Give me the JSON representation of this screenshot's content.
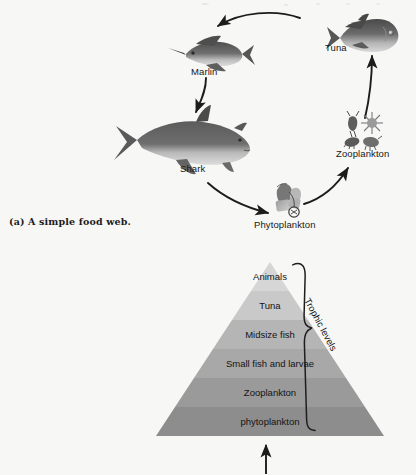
{
  "figure": {
    "caption": "(a) A simple food web."
  },
  "food_web": {
    "nodes": [
      {
        "key": "tuna",
        "label": "Tuna",
        "icon": "tuna-fish-icon"
      },
      {
        "key": "marlin",
        "label": "Marlin",
        "icon": "marlin-fish-icon"
      },
      {
        "key": "shark",
        "label": "Shark",
        "icon": "shark-fish-icon"
      },
      {
        "key": "phytoplankton",
        "label": "Phytoplankton",
        "icon": "phytoplankton-icon"
      },
      {
        "key": "zooplankton",
        "label": "Zooplankton",
        "icon": "zooplankton-icon"
      }
    ],
    "arrows": [
      {
        "from": "tuna",
        "to": "marlin"
      },
      {
        "from": "marlin",
        "to": "shark"
      },
      {
        "from": "shark",
        "to": "phytoplankton"
      },
      {
        "from": "phytoplankton",
        "to": "zooplankton"
      },
      {
        "from": "zooplankton",
        "to": "tuna"
      }
    ]
  },
  "pyramid": {
    "bracket_label": "Trophic levels",
    "levels": [
      {
        "label": "Animals",
        "color": "#d6d6d6"
      },
      {
        "label": "Tuna",
        "color": "#c9c9c9"
      },
      {
        "label": "Midsize fish",
        "color": "#b5b5b5"
      },
      {
        "label": "Small fish and larvae",
        "color": "#a8a8a8"
      },
      {
        "label": "Zooplankton",
        "color": "#9a9a9a"
      },
      {
        "label": "phytoplankton",
        "color": "#8d8d8d"
      }
    ],
    "input_arrow": "energy-input-arrow"
  },
  "colors": {
    "background": "#f7f7f6",
    "ink": "#141414",
    "fish_dark": "#4e4e4e",
    "fish_mid": "#7b7b7b",
    "fish_light": "#c2c2c2"
  }
}
